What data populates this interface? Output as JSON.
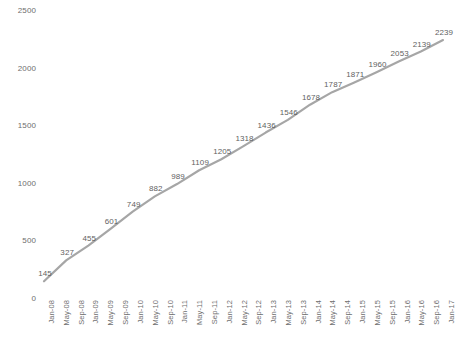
{
  "chart_data": {
    "type": "line",
    "title": "",
    "subtitle": "",
    "xlabel": "",
    "ylabel": "",
    "ylim": [
      0,
      2500
    ],
    "y_ticks": [
      0,
      500,
      1000,
      1500,
      2000,
      2500
    ],
    "grid": false,
    "legend": null,
    "legend_position": "none",
    "line_color": "#a6a6a6",
    "label_color": "#5f5f5f",
    "axis_text_color": "#6e6e6e",
    "x_tick_labels": [
      "Jan-08",
      "May-08",
      "Sep-08",
      "Jan-09",
      "May-09",
      "Sep-09",
      "Jan-10",
      "May-10",
      "Sep-10",
      "Jan-11",
      "May-11",
      "Sep-11",
      "Jan-12",
      "May-12",
      "Sep-12",
      "Jan-13",
      "May-13",
      "Sep-13",
      "Jan-14",
      "May-14",
      "Sep-14",
      "Jan-15",
      "May-15",
      "Sep-15",
      "Jan-16",
      "May-16",
      "Sep-16",
      "Jan-17"
    ],
    "categories": [
      "Jan-08",
      "Jul-08",
      "Jan-09",
      "Jul-09",
      "Jan-10",
      "Jul-10",
      "Jan-11",
      "Jul-11",
      "Jan-12",
      "Jul-12",
      "Jan-13",
      "Jul-13",
      "Jan-14",
      "Jul-14",
      "Jan-15",
      "Jul-15",
      "Jan-16",
      "Jul-16",
      "Jan-17"
    ],
    "values": [
      145,
      327,
      455,
      601,
      749,
      882,
      989,
      1109,
      1205,
      1318,
      1436,
      1546,
      1678,
      1787,
      1871,
      1960,
      2053,
      2139,
      2239
    ],
    "data_labels": [
      "145",
      "327",
      "455",
      "601",
      "749",
      "882",
      "989",
      "1109",
      "1205",
      "1318",
      "1436",
      "1546",
      "1678",
      "1787",
      "1871",
      "1960",
      "2053",
      "2139",
      "2239"
    ]
  }
}
